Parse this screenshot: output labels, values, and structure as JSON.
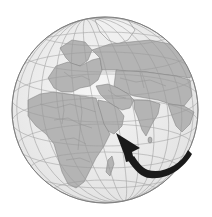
{
  "image": {
    "subject": "globe",
    "description": "Grayscale orthographic globe centered on the Middle East, showing Europe, Africa, Asia and the Indian Ocean, with a black curved arrow pointing at the Arabian Peninsula (Oman region)",
    "colors": {
      "background": "#ffffff",
      "ocean": "#eeeeee",
      "land": "#b4b4b4",
      "ice": "#f2f2f2",
      "graticule": "#9a9a9a",
      "border": "#7a7a7a",
      "arrow": "#1a1a1a"
    },
    "regions_visible": [
      "Europe",
      "Africa",
      "Arabian Peninsula",
      "Russia",
      "Central Asia",
      "India",
      "Southeast Asia",
      "Madagascar",
      "Greenland",
      "Indian Ocean"
    ],
    "annotation": {
      "type": "curved-arrow",
      "target": "Arabian Peninsula"
    }
  }
}
